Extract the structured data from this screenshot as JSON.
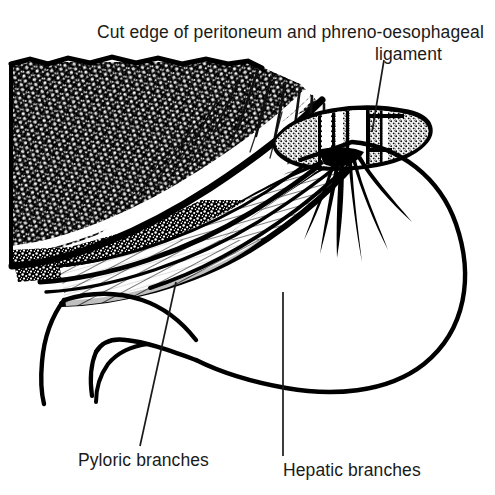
{
  "figure": {
    "title": "Cut edge of peritoneum and phreno-oesophageal ligament",
    "background_color": "#ffffff",
    "ink_color": "#000000",
    "text_color": "#1a1a1a"
  },
  "caption": {
    "line1": "Cut edge of peritoneum and phreno-oesophageal",
    "line2": "ligament"
  },
  "labels": {
    "pyloric": "Pyloric branches",
    "hepatic": "Hepatic branches"
  },
  "structures": {
    "diaphragm": "stippled-black-mass",
    "peritoneum": "hatched-band",
    "oesophagus": "stippled-lens-cross-section",
    "stomach": "greater-curvature-outline",
    "nerve_fan": "vagal-branch-filaments"
  }
}
